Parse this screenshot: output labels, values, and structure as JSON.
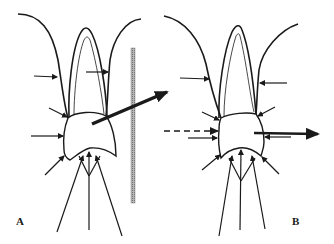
{
  "figure": {
    "panels": [
      {
        "id": "A",
        "label": "A",
        "description": "Tooth in socket with surrounding force arrows; a thick resultant arrow exits the crown diagonally up-right crossing a vertical hatched bar",
        "elements": [
          "socket-outline",
          "root-outer",
          "root-inner",
          "crown",
          "small-force-arrows",
          "occlusal-force-lines",
          "resultant-arrow",
          "vertical-bar"
        ]
      },
      {
        "id": "B",
        "label": "B",
        "description": "Tooth in socket with surrounding force arrows; a dashed arrow enters from the left and a thick horizontal resultant arrow exits to the right",
        "elements": [
          "socket-outline",
          "root-outer",
          "root-inner",
          "crown",
          "small-force-arrows",
          "occlusal-force-lines",
          "dashed-incoming-arrow",
          "resultant-arrow"
        ]
      }
    ],
    "colors": {
      "stroke": "#1a1a1a",
      "bar": "#9a9a9a",
      "background": "#ffffff"
    }
  }
}
